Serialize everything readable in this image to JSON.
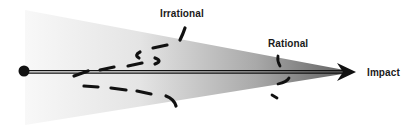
{
  "diagram": {
    "labels": {
      "irrational": "Irrational",
      "rational": "Rational",
      "impact": "Impact"
    },
    "elements": {
      "origin": "start-point-circle",
      "axis": "double-line-arrow",
      "cone": "gradient-cone-narrowing-toward-impact",
      "irrational_path": "dashed-curve-wide",
      "rational_path": "dashed-curve-narrow"
    },
    "colors": {
      "cone_light": "#f7f7f7",
      "cone_dark": "#6e6e6e",
      "ink": "#111111"
    }
  }
}
